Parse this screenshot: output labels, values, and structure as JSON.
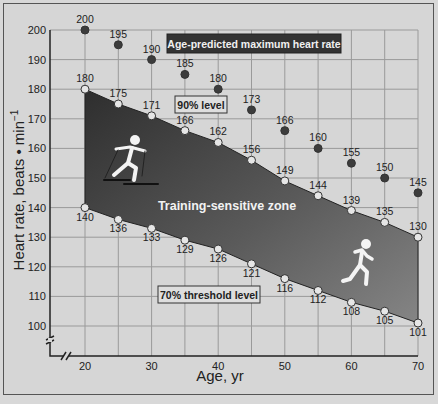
{
  "chart_data": {
    "type": "line",
    "title": "",
    "xlabel": "Age, yr",
    "ylabel": "Heart rate, beats • min⁻¹",
    "x": [
      20,
      25,
      30,
      35,
      40,
      45,
      50,
      55,
      60,
      65,
      70
    ],
    "x_ticks": [
      "20",
      "30",
      "40",
      "50",
      "60",
      "70"
    ],
    "y_ticks": [
      "100",
      "110",
      "120",
      "130",
      "140",
      "150",
      "160",
      "170",
      "180",
      "190",
      "200"
    ],
    "xlim": [
      20,
      70
    ],
    "ylim": [
      100,
      200
    ],
    "grid": true,
    "axis_breaks": true,
    "series": [
      {
        "name": "Age-predicted maximum heart rate",
        "marker": "dark-circle",
        "values": [
          200,
          195,
          190,
          185,
          180,
          173,
          166,
          160,
          155,
          150,
          145
        ]
      },
      {
        "name": "90% level",
        "marker": "open-circle",
        "values": [
          180,
          175,
          171,
          166,
          162,
          156,
          149,
          144,
          139,
          135,
          130
        ]
      },
      {
        "name": "70% threshold level",
        "marker": "open-circle",
        "values": [
          140,
          136,
          133,
          129,
          126,
          121,
          116,
          112,
          108,
          105,
          101
        ]
      }
    ],
    "annotations": [
      {
        "text": "Age-predicted maximum heart rate",
        "style": "dark-box"
      },
      {
        "text": "90% level",
        "style": "outlined-box"
      },
      {
        "text": "70% threshold level",
        "style": "outlined-box"
      },
      {
        "text": "Training-sensitive zone",
        "style": "shaded-region-label"
      }
    ],
    "icons": [
      "cross-country-skier-icon",
      "runner-icon"
    ]
  },
  "labels": {
    "xlabel": "Age, yr",
    "ylabel": "Heart rate, beats • min",
    "ylabel_sup": "−1",
    "max_box": "Age-predicted maximum heart rate",
    "ninety_box": "90% level",
    "seventy_box": "70% threshold level",
    "zone": "Training-sensitive zone"
  },
  "colors": {
    "background": "#d6d6d6",
    "grid": "#9a9a9a",
    "zone_dark": "#3a3a3a",
    "zone_light": "#8a8a8a",
    "max_marker": "#3c3c3c",
    "open_marker": "#e6e6e6"
  }
}
